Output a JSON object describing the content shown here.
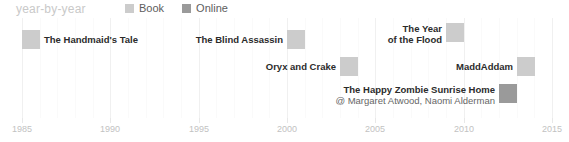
{
  "header": {
    "title": "year-by-year"
  },
  "legend": {
    "position": "top",
    "items": [
      {
        "label": "Book",
        "color": "#cccccc",
        "icon": "square-swatch-icon"
      },
      {
        "label": "Online",
        "color": "#9a9a9a",
        "icon": "square-swatch-icon"
      }
    ]
  },
  "chart_data": {
    "type": "timeline",
    "title": "year-by-year",
    "xlabel": "",
    "ylabel": "",
    "xlim": [
      1985,
      2015
    ],
    "grid": true,
    "grid_minor_step": 1,
    "grid_major_step": 5,
    "legend_position": "top",
    "tick_labels": [
      "1985",
      "1990",
      "1995",
      "2000",
      "2005",
      "2010",
      "2015"
    ],
    "tick_values": [
      1985,
      1990,
      1995,
      2000,
      2005,
      2010,
      2015
    ],
    "categories": [
      "Book",
      "Online"
    ],
    "category_colors": {
      "Book": "#cccccc",
      "Online": "#9a9a9a"
    },
    "points": [
      {
        "title": "The Handmaid's Tale",
        "subtitle": "",
        "year": 1985,
        "category": "Book",
        "label_side": "right"
      },
      {
        "title": "The Blind Assassin",
        "subtitle": "",
        "year": 2000,
        "category": "Book",
        "label_side": "left"
      },
      {
        "title": "Oryx and Crake",
        "subtitle": "",
        "year": 2003,
        "category": "Book",
        "label_side": "left"
      },
      {
        "title": "The Year\nof the Flood",
        "title_line1": "The Year",
        "title_line2": "of the Flood",
        "subtitle": "",
        "year": 2009,
        "category": "Book",
        "label_side": "left"
      },
      {
        "title": "MaddAddam",
        "subtitle": "",
        "year": 2013,
        "category": "Book",
        "label_side": "left"
      },
      {
        "title": "The Happy Zombie Sunrise Home",
        "subtitle": "@ Margaret Atwood, Naomi Alderman",
        "year": 2012,
        "category": "Online",
        "label_side": "left"
      }
    ]
  }
}
